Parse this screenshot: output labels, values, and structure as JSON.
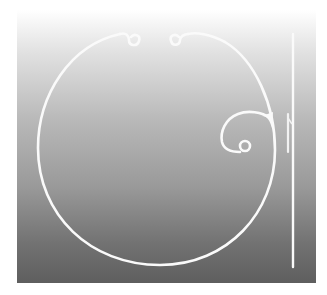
{
  "figure": {
    "colors": {
      "background_top": "#ffffff",
      "background_bottom": "#5e5e5e",
      "wire": "#fafafa"
    },
    "parts": [
      {
        "name": "ring-loop"
      },
      {
        "name": "top-left-eyelet"
      },
      {
        "name": "top-right-eyelet"
      },
      {
        "name": "inner-curl-hook"
      },
      {
        "name": "curl-eyelet"
      },
      {
        "name": "side-profile-view"
      }
    ]
  }
}
